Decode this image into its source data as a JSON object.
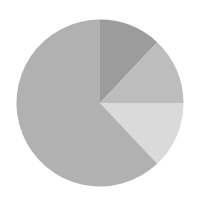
{
  "chart_data": {
    "type": "pie",
    "title": "",
    "legend": [],
    "start_angle_deg": 0,
    "direction": "clockwise",
    "center": [
      100,
      103
    ],
    "radius": 83.5,
    "slices": [
      {
        "label": "",
        "value": 12,
        "color": "#9c9c9c"
      },
      {
        "label": "",
        "value": 13,
        "color": "#bdbdbd"
      },
      {
        "label": "",
        "value": 13,
        "color": "#dadada"
      },
      {
        "label": "",
        "value": 62,
        "color": "#b1b1b1"
      }
    ],
    "categories": [
      "Slice 1",
      "Slice 2",
      "Slice 3",
      "Slice 4"
    ],
    "values": [
      12,
      13,
      13,
      62
    ]
  }
}
